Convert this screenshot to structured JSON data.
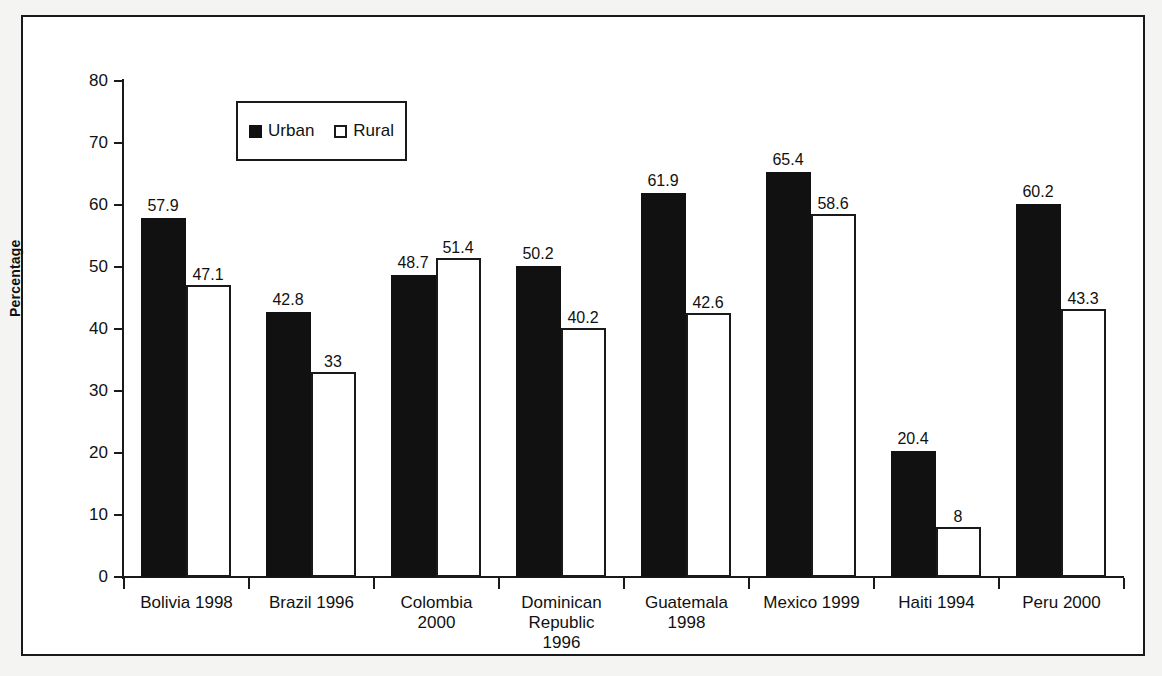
{
  "chart_data": {
    "type": "bar",
    "title": "",
    "subtitle": "",
    "xlabel": "",
    "ylabel": "Percentage",
    "ylim": [
      0,
      80
    ],
    "ytick_step": 10,
    "yticks": [
      0,
      10,
      20,
      30,
      40,
      50,
      60,
      70,
      80
    ],
    "grid": false,
    "legend_position": "top-left-inside",
    "categories": [
      "Bolivia 1998",
      "Brazil 1996",
      "Colombia 2000",
      "Dominican Republic 1996",
      "Guatemala 1998",
      "Mexico 1999",
      "Haiti 1994",
      "Peru 2000"
    ],
    "category_lines": [
      [
        "Bolivia 1998"
      ],
      [
        "Brazil 1996"
      ],
      [
        "Colombia",
        "2000"
      ],
      [
        "Dominican",
        "Republic",
        "1996"
      ],
      [
        "Guatemala",
        "1998"
      ],
      [
        "Mexico 1999"
      ],
      [
        "Haiti 1994"
      ],
      [
        "Peru 2000"
      ]
    ],
    "series": [
      {
        "name": "Urban",
        "color": "#111111",
        "style": "filled",
        "values": [
          57.9,
          42.8,
          48.7,
          50.2,
          61.9,
          65.4,
          20.4,
          60.2
        ],
        "labels": [
          "57.9",
          "42.8",
          "48.7",
          "50.2",
          "61.9",
          "65.4",
          "20.4",
          "60.2"
        ]
      },
      {
        "name": "Rural",
        "color": "#ffffff",
        "style": "outlined",
        "values": [
          47.1,
          33,
          51.4,
          40.2,
          42.6,
          58.6,
          8,
          43.3
        ],
        "labels": [
          "47.1",
          "33",
          "51.4",
          "40.2",
          "42.6",
          "58.6",
          "8",
          "43.3"
        ]
      }
    ]
  },
  "legend": {
    "entries": [
      {
        "label": "Urban",
        "swatch": "filled-square"
      },
      {
        "label": "Rural",
        "swatch": "hollow-square"
      }
    ]
  },
  "colors": {
    "urban": "#111111",
    "rural_fill": "#ffffff",
    "outline": "#1a1a1a",
    "page_background": "#f4f4f2",
    "plot_background": "#ffffff"
  }
}
